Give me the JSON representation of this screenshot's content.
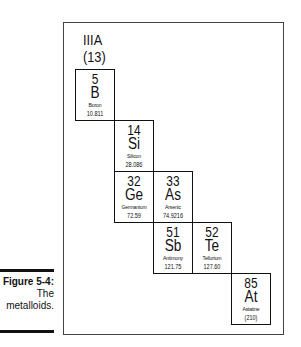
{
  "figure": {
    "label": "Figure 5-4:",
    "caption_line1": "The",
    "caption_line2": "metalloids."
  },
  "group": {
    "roman": "IIIA",
    "number": "(13)"
  },
  "elements": [
    {
      "number": "5",
      "symbol": "B",
      "name": "Boron",
      "mass": "10.811"
    },
    {
      "number": "14",
      "symbol": "Si",
      "name": "Silicon",
      "mass": "28.086"
    },
    {
      "number": "32",
      "symbol": "Ge",
      "name": "Germanium",
      "mass": "72.59"
    },
    {
      "number": "33",
      "symbol": "As",
      "name": "Arsenic",
      "mass": "74.9216"
    },
    {
      "number": "51",
      "symbol": "Sb",
      "name": "Antimony",
      "mass": "121.75"
    },
    {
      "number": "52",
      "symbol": "Te",
      "name": "Tellurium",
      "mass": "127.60"
    },
    {
      "number": "85",
      "symbol": "At",
      "name": "Astatine",
      "mass": "(210)"
    }
  ]
}
